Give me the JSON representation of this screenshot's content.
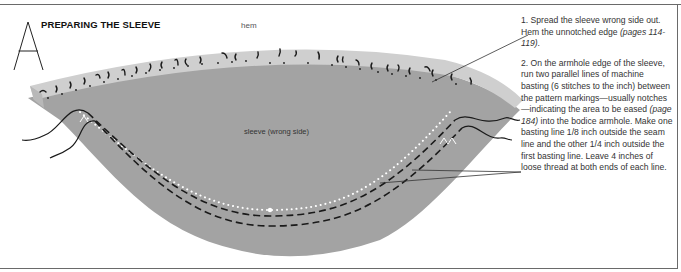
{
  "figure": {
    "letter": "A",
    "title": "PREPARING THE SLEEVE"
  },
  "labels": {
    "hem": "hem",
    "sleeve": "sleeve (wrong side)"
  },
  "steps": [
    {
      "number": "1.",
      "text_before": "Spread the sleeve wrong side out. Hem the unnotched edge ",
      "ref": "(pages 114-119)",
      "text_after": "."
    },
    {
      "number": "2.",
      "text_before": "On the armhole edge of the sleeve, run two parallel lines of machine basting (6 stitches to the inch) between the pattern markings—usually notches —indicating the area to be eased ",
      "ref": "(page 184)",
      "text_after": " into the bodice armhole. Make one basting line 1/8 inch outside the seam line and the other 1/4 inch outside the first basting line. Leave 4 inches of loose thread at both ends of each line."
    }
  ],
  "colors": {
    "sleeve_fill": "#a3a3a3",
    "hem_fill": "#cfcfcf",
    "stitch": "#1a1a1a",
    "seam_dots": "#ffffff",
    "frame": "#6a6a6a"
  }
}
